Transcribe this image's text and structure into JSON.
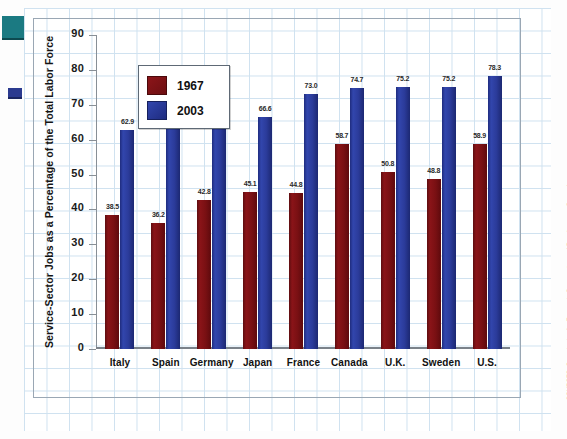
{
  "chart_data": {
    "type": "bar",
    "title": "",
    "xlabel": "",
    "ylabel": "Service-Sector Jobs as a Percentage of the Total Labor Force",
    "ylim": [
      0,
      90
    ],
    "yticks": [
      0,
      10,
      20,
      30,
      40,
      50,
      60,
      70,
      80,
      90
    ],
    "grid": true,
    "legend_position": "upper-left-inside",
    "categories": [
      "Italy",
      "Spain",
      "Germany",
      "Japan",
      "France",
      "Canada",
      "U.K.",
      "Sweden",
      "U.S."
    ],
    "series": [
      {
        "name": "1967",
        "color": "#7a1013",
        "values": [
          38.5,
          36.2,
          42.8,
          45.1,
          44.8,
          58.7,
          50.8,
          48.8,
          58.9
        ]
      },
      {
        "name": "2003",
        "color": "#2b3b9a",
        "values": [
          62.9,
          63.6,
          65.6,
          66.6,
          73.0,
          74.7,
          75.2,
          75.2,
          78.3
        ]
      }
    ],
    "value_labels": {
      "1967": [
        "38.5",
        "36.2",
        "42.8",
        "45.1",
        "44.8",
        "58.7",
        "50.8",
        "48.8",
        "58.9"
      ],
      "2003": [
        "62.9",
        "63.6",
        "65.6",
        "66.6",
        "73.0",
        "74.7",
        "75.2",
        "75.2",
        "78.3"
      ]
    }
  },
  "legend": {
    "items": [
      {
        "label": "1967",
        "color": "#7a1013"
      },
      {
        "label": "2003",
        "color": "#2b3b9a"
      }
    ]
  },
  "axis": {
    "y_title": "Service-Sector Jobs as a Percentage of the Total Labor Force",
    "y_tick_labels": [
      "90",
      "80",
      "70",
      "60",
      "50",
      "40",
      "30",
      "20",
      "10",
      "0"
    ]
  },
  "sources": {
    "text": "SOURCES: Organisation for Economic Cooperation and Development, Quarterly Labor Force Statistics, various issues, and OECD in Figures, various years, http://www.sourceoecd.org"
  }
}
